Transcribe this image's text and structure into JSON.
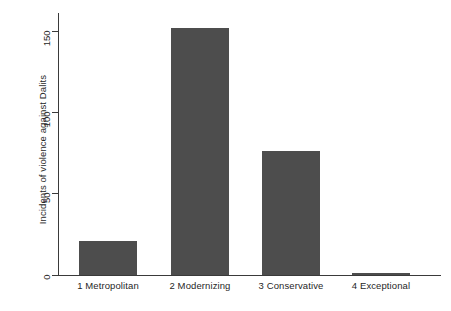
{
  "chart_data": {
    "type": "bar",
    "title": "",
    "subtitle": "",
    "xlabel": "",
    "ylabel": "Incidents of violence against Dalits",
    "categories": [
      "1 Metropolitan",
      "2 Modernizing",
      "3 Conservative",
      "4 Exceptional"
    ],
    "values": [
      21,
      152,
      76,
      1
    ],
    "ylim": [
      0,
      161
    ],
    "yticks": [
      0,
      50,
      100,
      150
    ],
    "ytick_labels": [
      "0",
      "50",
      "100",
      "150"
    ],
    "grid": false,
    "legend": null,
    "legend_position": "none",
    "series": [
      {
        "name": "Incidents of violence against Dalits",
        "values": [
          21,
          152,
          76,
          1
        ]
      }
    ],
    "bar_color": "#4d4d4d",
    "axis_color": "#3a3a3a",
    "text_color": "#1f1f1f",
    "background": "#ffffff"
  },
  "axis": {
    "y_title": "Incidents of violence against Dalits",
    "ticks": [
      {
        "label": "150",
        "value": 150
      },
      {
        "label": "100",
        "value": 100
      },
      {
        "label": "50",
        "value": 50
      },
      {
        "label": "0",
        "value": 0
      }
    ]
  },
  "bars": [
    {
      "label": "1 Metropolitan",
      "value": 21
    },
    {
      "label": "2 Modernizing",
      "value": 152
    },
    {
      "label": "3 Conservative",
      "value": 76
    },
    {
      "label": "4 Exceptional",
      "value": 1
    }
  ]
}
